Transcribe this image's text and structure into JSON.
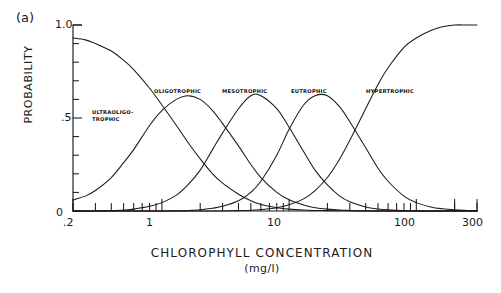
{
  "figure": {
    "panel_label": "(a)",
    "background_color": "#ffffff",
    "line_color": "#1a1a1a"
  },
  "chart_data": {
    "type": "line",
    "title": "",
    "panel": "(a)",
    "xlabel": "CHLOROPHYLL CONCENTRATION",
    "xunits": "(mg/l)",
    "ylabel": "PROBABILITY",
    "xscale": "log",
    "xlim": [
      0.2,
      300
    ],
    "ylim": [
      0,
      1.0
    ],
    "grid": false,
    "legend": "inline-curve-labels",
    "xticks": [
      0.2,
      1,
      10,
      100,
      300
    ],
    "xtick_labels": [
      ".2",
      "1",
      "10",
      "100",
      "300"
    ],
    "yticks": [
      0,
      0.1,
      0.2,
      0.3,
      0.4,
      0.5,
      0.6,
      0.7,
      0.8,
      0.9,
      1.0
    ],
    "ytick_labels": [
      "0",
      "",
      "",
      "",
      "",
      ".5",
      "",
      "",
      "",
      "",
      "1.0"
    ],
    "x": [
      0.2,
      0.25,
      0.3,
      0.4,
      0.5,
      0.6,
      0.8,
      1.0,
      1.3,
      1.6,
      2.0,
      2.5,
      3.0,
      4.0,
      5.0,
      6.0,
      8.0,
      10,
      13,
      16,
      20,
      25,
      30,
      40,
      50,
      60,
      80,
      100,
      130,
      160,
      200,
      250,
      300
    ],
    "series": [
      {
        "name": "ULTRAOLIGO-TROPHIC",
        "label_lines": [
          "ULTRAOLIGO-",
          "TROPHIC"
        ],
        "shape": "descending-sigmoid",
        "peak_x": 0.2,
        "peak_y": 0.93,
        "values": [
          0.93,
          0.92,
          0.9,
          0.86,
          0.81,
          0.76,
          0.66,
          0.57,
          0.46,
          0.37,
          0.28,
          0.2,
          0.15,
          0.09,
          0.055,
          0.035,
          0.018,
          0.01,
          0.005,
          0.003,
          0.002,
          0.001,
          0.001,
          0.0,
          0.0,
          0.0,
          0.0,
          0.0,
          0.0,
          0.0,
          0.0,
          0.0,
          0.0
        ]
      },
      {
        "name": "OLIGOTROPHIC",
        "label_lines": [
          "OLIGOTROPHIC"
        ],
        "shape": "bell",
        "peak_x": 1.6,
        "peak_y": 0.62,
        "values": [
          0.06,
          0.08,
          0.11,
          0.18,
          0.26,
          0.33,
          0.46,
          0.54,
          0.6,
          0.62,
          0.6,
          0.54,
          0.47,
          0.35,
          0.25,
          0.18,
          0.1,
          0.06,
          0.032,
          0.018,
          0.01,
          0.005,
          0.003,
          0.001,
          0.0,
          0.0,
          0.0,
          0.0,
          0.0,
          0.0,
          0.0,
          0.0,
          0.0
        ]
      },
      {
        "name": "MESOTROPHIC",
        "label_lines": [
          "MESOTROPHIC"
        ],
        "shape": "bell",
        "peak_x": 5.0,
        "peak_y": 0.62,
        "values": [
          0.0,
          0.0,
          0.0,
          0.002,
          0.005,
          0.01,
          0.025,
          0.045,
          0.085,
          0.14,
          0.22,
          0.33,
          0.42,
          0.55,
          0.62,
          0.62,
          0.55,
          0.45,
          0.32,
          0.22,
          0.14,
          0.08,
          0.05,
          0.022,
          0.011,
          0.006,
          0.002,
          0.001,
          0.0,
          0.0,
          0.0,
          0.0,
          0.0
        ]
      },
      {
        "name": "EUTROPHIC",
        "label_lines": [
          "EUTROPHIC"
        ],
        "shape": "bell",
        "peak_x": 20,
        "peak_y": 0.62,
        "values": [
          0.0,
          0.0,
          0.0,
          0.0,
          0.0,
          0.0,
          0.0,
          0.0,
          0.001,
          0.003,
          0.007,
          0.015,
          0.025,
          0.055,
          0.1,
          0.16,
          0.3,
          0.44,
          0.57,
          0.62,
          0.62,
          0.56,
          0.48,
          0.34,
          0.23,
          0.16,
          0.08,
          0.045,
          0.022,
          0.012,
          0.006,
          0.003,
          0.001
        ]
      },
      {
        "name": "HYPERTROPHIC",
        "label_lines": [
          "HYPERTROPHIC"
        ],
        "shape": "ascending-sigmoid",
        "peak_x": 300,
        "peak_y": 1.0,
        "values": [
          0.0,
          0.0,
          0.0,
          0.0,
          0.0,
          0.0,
          0.0,
          0.0,
          0.0,
          0.0,
          0.0,
          0.0,
          0.0,
          0.002,
          0.004,
          0.008,
          0.018,
          0.033,
          0.065,
          0.11,
          0.18,
          0.28,
          0.38,
          0.55,
          0.68,
          0.77,
          0.88,
          0.93,
          0.97,
          0.99,
          1.0,
          1.0,
          1.0
        ]
      }
    ]
  },
  "curve_labels": {
    "ultraoligotrophic_line1": "ULTRAOLIGO-",
    "ultraoligotrophic_line2": "TROPHIC",
    "oligotrophic": "OLIGOTROPHIC",
    "mesotrophic": "MESOTROPHIC",
    "eutrophic": "EUTROPHIC",
    "hypertrophic": "HYPERTROPHIC"
  },
  "axes": {
    "y_title": "PROBABILITY",
    "x_title": "CHLOROPHYLL CONCENTRATION",
    "x_units": "(mg/l)",
    "y_label_top": "1.0",
    "y_label_mid": ".5",
    "y_label_bottom": "0",
    "x_label_1": ".2",
    "x_label_2": "1",
    "x_label_3": "10",
    "x_label_4": "100",
    "x_label_5": "300"
  }
}
